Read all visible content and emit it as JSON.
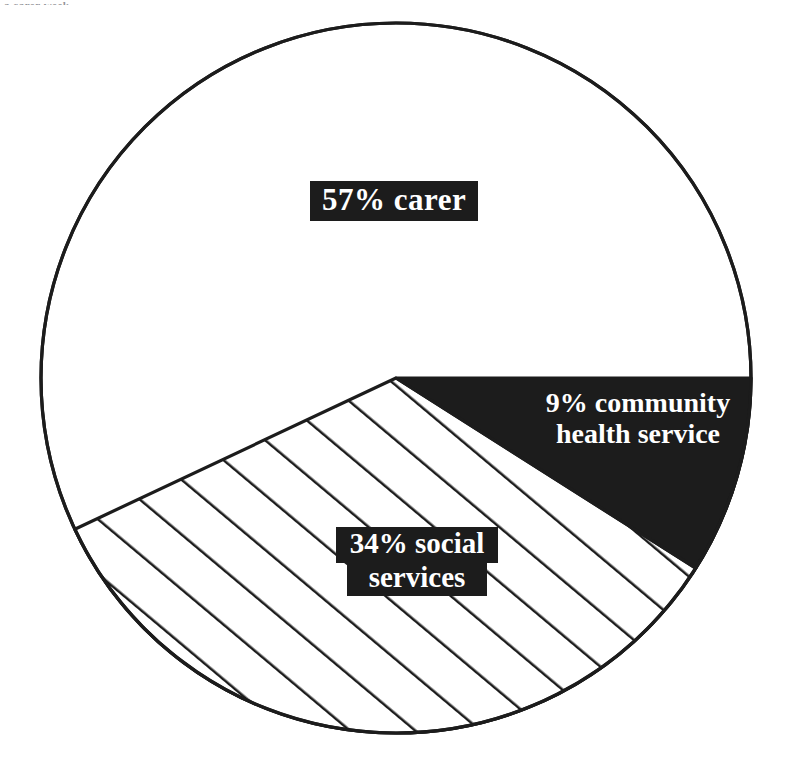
{
  "page": {
    "top_cut_text": "a carer week",
    "background_color": "#ffffff",
    "ink_color": "#1c1c1c"
  },
  "chart_data": {
    "type": "pie",
    "title": "",
    "subtitle": "",
    "xlabel": "",
    "ylabel": "",
    "grid": false,
    "legend_position": "none",
    "labels_inside": true,
    "total_percent": 100,
    "center": {
      "x": 396,
      "y": 378
    },
    "radius": 355,
    "start_angle_deg": 0,
    "direction": "clockwise",
    "categories": [
      "community health service",
      "social services",
      "carer"
    ],
    "values": [
      9,
      34,
      57
    ],
    "slices": [
      {
        "name": "community health service",
        "label": "9% community health service",
        "percent": 9,
        "value_text": "9%",
        "fill": "solid-black",
        "fill_color": "#1c1c1c",
        "text_color": "#ffffff",
        "boxed_label": false,
        "start_angle_deg": 0,
        "end_angle_deg": 32.4,
        "label_lines": [
          "9% community",
          "health service"
        ]
      },
      {
        "name": "social services",
        "label": "34% social services",
        "percent": 34,
        "value_text": "34%",
        "fill": "diagonal-hatch",
        "fill_color": "#ffffff",
        "hatch_color": "#1c1c1c",
        "text_color": "#ffffff",
        "boxed_label": true,
        "box_color": "#1c1c1c",
        "start_angle_deg": 32.4,
        "end_angle_deg": 154.8,
        "label_lines": [
          "34% social",
          "services"
        ]
      },
      {
        "name": "carer",
        "label": "57% carer",
        "percent": 57,
        "value_text": "57%",
        "fill": "white",
        "fill_color": "#ffffff",
        "text_color": "#ffffff",
        "boxed_label": true,
        "box_color": "#1c1c1c",
        "start_angle_deg": 154.8,
        "end_angle_deg": 360,
        "label_lines": [
          "57% carer"
        ]
      }
    ]
  },
  "labels": {
    "carer": {
      "line1": "57% carer"
    },
    "social": {
      "line1": "34% social",
      "line2": "services"
    },
    "community": {
      "line1": "9% community",
      "line2": "health service"
    }
  }
}
